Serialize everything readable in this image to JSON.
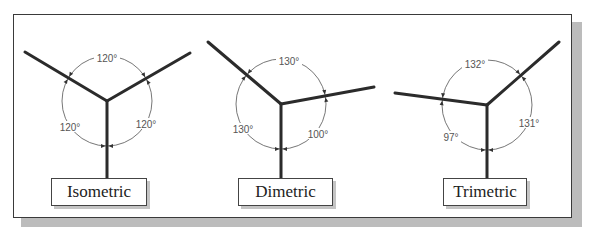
{
  "panels": [
    {
      "id": "isometric",
      "label": "Isometric",
      "center": [
        107,
        101
      ],
      "radius": 45,
      "axes": [
        [
          25,
          52
        ],
        [
          190,
          53
        ],
        [
          107,
          178
        ]
      ],
      "angles": [
        {
          "text": "120°",
          "x": 107,
          "y": 59
        },
        {
          "text": "120°",
          "x": 70,
          "y": 128
        },
        {
          "text": "120°",
          "x": 146,
          "y": 125
        }
      ],
      "box": {
        "x": 51,
        "y": 178,
        "w": 96
      }
    },
    {
      "id": "dimetric",
      "label": "Dimetric",
      "center": [
        281,
        104
      ],
      "radius": 45,
      "axes": [
        [
          208,
          42
        ],
        [
          374,
          87
        ],
        [
          281,
          178
        ]
      ],
      "angles": [
        {
          "text": "130°",
          "x": 289,
          "y": 62
        },
        {
          "text": "130°",
          "x": 243,
          "y": 130
        },
        {
          "text": "100°",
          "x": 318,
          "y": 135
        }
      ],
      "box": {
        "x": 238,
        "y": 178,
        "w": 95
      }
    },
    {
      "id": "trimetric",
      "label": "Trimetric",
      "center": [
        487,
        105
      ],
      "radius": 45,
      "axes": [
        [
          395,
          93
        ],
        [
          559,
          42
        ],
        [
          487,
          178
        ]
      ],
      "angles": [
        {
          "text": "132°",
          "x": 475,
          "y": 65
        },
        {
          "text": "97°",
          "x": 451,
          "y": 138
        },
        {
          "text": "131°",
          "x": 529,
          "y": 124
        }
      ],
      "box": {
        "x": 443,
        "y": 178,
        "w": 84
      }
    }
  ],
  "colors": {
    "line": "#2b2b2b",
    "arc": "#777777",
    "shadow": "#bcbcbc"
  }
}
